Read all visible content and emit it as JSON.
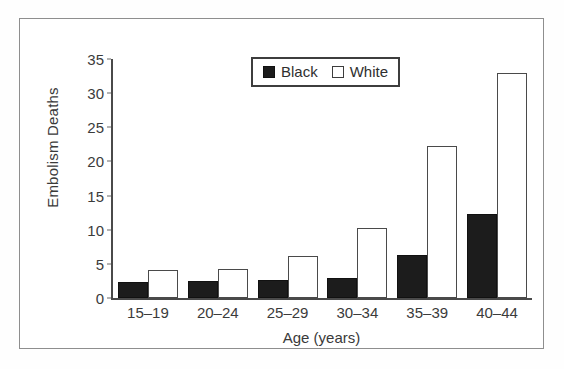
{
  "chart_data": {
    "type": "bar",
    "title": "",
    "xlabel": "Age (years)",
    "ylabel": "Embolism Deaths",
    "categories": [
      "15–19",
      "20–24",
      "25–29",
      "30–34",
      "35–39",
      "40–44"
    ],
    "series": [
      {
        "name": "Black",
        "color": "#1c1c1c",
        "values": [
          2.4,
          2.5,
          2.6,
          2.9,
          6.3,
          12.3
        ]
      },
      {
        "name": "White",
        "color": "#ffffff",
        "values": [
          4.1,
          4.2,
          6.2,
          10.2,
          22.2,
          33.0
        ]
      }
    ],
    "ylim": [
      0,
      35
    ],
    "yticks": [
      0,
      5,
      10,
      15,
      20,
      25,
      30,
      35
    ],
    "ytick_labels": [
      "0",
      "5",
      "10",
      "15",
      "20",
      "25",
      "30",
      "35"
    ],
    "grid": false,
    "legend_position": "top-center",
    "legend": [
      "Black",
      "White"
    ]
  },
  "legend": {
    "black_label": "Black",
    "white_label": "White"
  },
  "axes": {
    "y_title": "Embolism Deaths",
    "x_title": "Age (years)"
  }
}
